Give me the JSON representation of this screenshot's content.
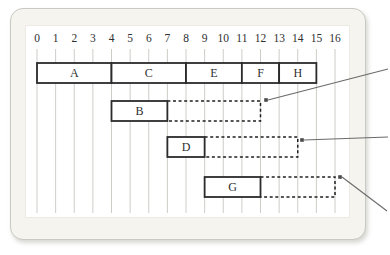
{
  "colors": {
    "page_bg": "#ffffff",
    "panel_bg": "#f5f4ef",
    "panel_border": "#c9c9c3",
    "plot_bg": "#ffffff",
    "grid": "#cdcdc8",
    "box_border": "#2b2b2b",
    "dashed_border": "#1f1f1f",
    "text": "#2f2f2f",
    "arrow": "#6a6a6a",
    "dot": "#4a4a4a"
  },
  "axis": {
    "min": 0,
    "max": 16,
    "ticks": [
      "0",
      "1",
      "2",
      "3",
      "4",
      "5",
      "6",
      "7",
      "8",
      "9",
      "10",
      "11",
      "12",
      "13",
      "14",
      "15",
      "16"
    ]
  },
  "rows": [
    {
      "name": "segment-row-top",
      "blocks": [
        {
          "label": "A",
          "start": 0,
          "end": 4
        },
        {
          "label": "C",
          "start": 4,
          "end": 8
        },
        {
          "label": "E",
          "start": 8,
          "end": 11
        },
        {
          "label": "F",
          "start": 11,
          "end": 13
        },
        {
          "label": "H",
          "start": 13,
          "end": 15
        }
      ],
      "dashed": null
    },
    {
      "name": "segment-row-b",
      "blocks": [
        {
          "label": "B",
          "start": 4,
          "end": 7
        }
      ],
      "dashed": {
        "start": 7,
        "end": 12
      }
    },
    {
      "name": "segment-row-d",
      "blocks": [
        {
          "label": "D",
          "start": 7,
          "end": 9
        }
      ],
      "dashed": {
        "start": 9,
        "end": 14
      }
    },
    {
      "name": "segment-row-g",
      "blocks": [
        {
          "label": "G",
          "start": 9,
          "end": 12
        }
      ],
      "dashed": {
        "start": 12,
        "end": 16
      }
    }
  ],
  "callouts": [
    {
      "name": "callout-b",
      "points_to_unit": 12,
      "dot": [
        266,
        100
      ],
      "line_end": [
        388,
        69
      ]
    },
    {
      "name": "callout-d",
      "points_to_unit": 14,
      "dot": [
        302,
        140
      ],
      "line_end": [
        388,
        137
      ]
    },
    {
      "name": "callout-g",
      "points_to_unit": 16,
      "dot": [
        340,
        177
      ],
      "line_end": [
        387,
        211
      ]
    }
  ]
}
